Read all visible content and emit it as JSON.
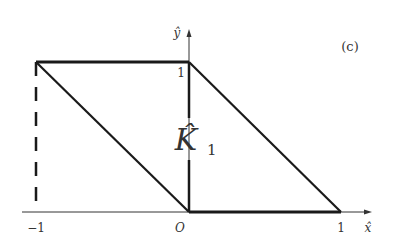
{
  "figure": {
    "panel_label": "(c)",
    "axes": {
      "x_label": "x̂",
      "y_label": "ŷ",
      "origin_label": "O",
      "x_ticks": [
        "−1",
        "1"
      ],
      "y_ticks": [
        "1"
      ]
    },
    "region_label": {
      "main": "K̂",
      "subscript": "1"
    },
    "shapes": [
      {
        "name": "parallelogram",
        "vertices": [
          [
            -1,
            1
          ],
          [
            0,
            1
          ],
          [
            1,
            0
          ],
          [
            0,
            0
          ]
        ],
        "style": "solid-thick"
      },
      {
        "name": "vertical-left",
        "from": [
          -1,
          0
        ],
        "to": [
          -1,
          1
        ],
        "style": "dashed"
      },
      {
        "name": "vertical-center",
        "from": [
          0,
          0
        ],
        "to": [
          0,
          1
        ],
        "style": "solid"
      }
    ],
    "colors": {
      "line": "#1a1a1a",
      "text": "#333333",
      "background": "#ffffff"
    }
  }
}
